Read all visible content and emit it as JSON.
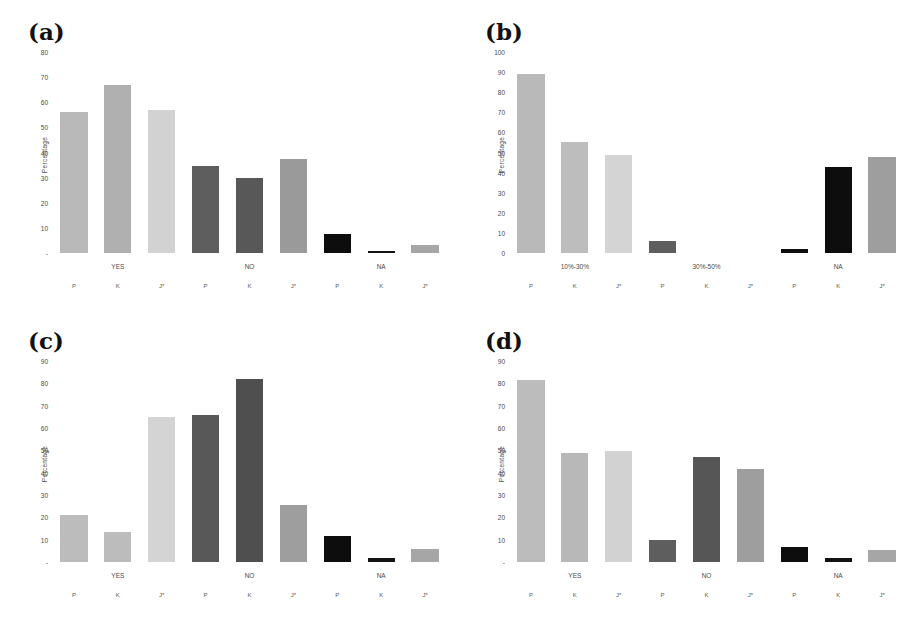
{
  "figure": {
    "background": "#ffffff",
    "panel_count": 4
  },
  "panels": [
    {
      "id": "a",
      "label": "(a)",
      "ylabel": "Percentage",
      "yticks": [
        "-",
        "10",
        "20",
        "30",
        "40",
        "50",
        "60",
        "70",
        "80"
      ],
      "ymax": 80,
      "groups": [
        "YES",
        "NO",
        "NA"
      ],
      "series": [
        "P",
        "K",
        "J*"
      ],
      "bars": [
        {
          "group": "YES",
          "series": "P",
          "value": 56,
          "color": "#b9b9b9"
        },
        {
          "group": "YES",
          "series": "K",
          "value": 67,
          "color": "#b0b0b0"
        },
        {
          "group": "YES",
          "series": "J*",
          "value": 57,
          "color": "#d2d2d2"
        },
        {
          "group": "NO",
          "series": "P",
          "value": 34.5,
          "color": "#5e5e5e"
        },
        {
          "group": "NO",
          "series": "K",
          "value": 30,
          "color": "#585858"
        },
        {
          "group": "NO",
          "series": "J*",
          "value": 37.5,
          "color": "#9a9a9a"
        },
        {
          "group": "NA",
          "series": "P",
          "value": 7.5,
          "color": "#0d0d0d"
        },
        {
          "group": "NA",
          "series": "K",
          "value": 1,
          "color": "#121212"
        },
        {
          "group": "NA",
          "series": "J*",
          "value": 3,
          "color": "#a6a6a6"
        }
      ]
    },
    {
      "id": "b",
      "label": "(b)",
      "ylabel": "Percentage",
      "yticks": [
        "0",
        "10",
        "20",
        "30",
        "40",
        "50",
        "60",
        "70",
        "80",
        "90",
        "100"
      ],
      "ymax": 100,
      "groups": [
        "10%-30%",
        "30%-50%",
        "NA"
      ],
      "series": [
        "P",
        "K",
        "J*"
      ],
      "bars": [
        {
          "group": "10%-30%",
          "series": "P",
          "value": 89,
          "color": "#b9b9b9"
        },
        {
          "group": "10%-30%",
          "series": "K",
          "value": 55,
          "color": "#bdbdbd"
        },
        {
          "group": "10%-30%",
          "series": "J*",
          "value": 49,
          "color": "#d4d4d4"
        },
        {
          "group": "30%-50%",
          "series": "P",
          "value": 6,
          "color": "#5e5e5e"
        },
        {
          "group": "30%-50%",
          "series": "K",
          "value": 0,
          "color": "#585858"
        },
        {
          "group": "30%-50%",
          "series": "J*",
          "value": 0,
          "color": "#9a9a9a"
        },
        {
          "group": "NA",
          "series": "P",
          "value": 2,
          "color": "#0d0d0d"
        },
        {
          "group": "NA",
          "series": "K",
          "value": 43,
          "color": "#0d0d0d"
        },
        {
          "group": "NA",
          "series": "J*",
          "value": 48,
          "color": "#9e9e9e"
        }
      ]
    },
    {
      "id": "c",
      "label": "(c)",
      "ylabel": "Percentage",
      "yticks": [
        "-",
        "10",
        "20",
        "30",
        "40",
        "50",
        "60",
        "70",
        "80",
        "90"
      ],
      "ymax": 90,
      "groups": [
        "YES",
        "NO",
        "NA"
      ],
      "series": [
        "P",
        "K",
        "J*"
      ],
      "bars": [
        {
          "group": "YES",
          "series": "P",
          "value": 21,
          "color": "#bcbcbc"
        },
        {
          "group": "YES",
          "series": "K",
          "value": 13.5,
          "color": "#bcbcbc"
        },
        {
          "group": "YES",
          "series": "J*",
          "value": 65,
          "color": "#d4d4d4"
        },
        {
          "group": "NO",
          "series": "P",
          "value": 66,
          "color": "#585858"
        },
        {
          "group": "NO",
          "series": "K",
          "value": 82,
          "color": "#4f4f4f"
        },
        {
          "group": "NO",
          "series": "J*",
          "value": 25.5,
          "color": "#9e9e9e"
        },
        {
          "group": "NA",
          "series": "P",
          "value": 11.5,
          "color": "#0d0d0d"
        },
        {
          "group": "NA",
          "series": "K",
          "value": 2,
          "color": "#121212"
        },
        {
          "group": "NA",
          "series": "J*",
          "value": 6,
          "color": "#a6a6a6"
        }
      ]
    },
    {
      "id": "d",
      "label": "(d)",
      "ylabel": "Percentage",
      "yticks": [
        "-",
        "10",
        "20",
        "30",
        "40",
        "50",
        "60",
        "70",
        "80",
        "90"
      ],
      "ymax": 90,
      "groups": [
        "YES",
        "NO",
        "NA"
      ],
      "series": [
        "P",
        "K",
        "J*"
      ],
      "bars": [
        {
          "group": "YES",
          "series": "P",
          "value": 81.5,
          "color": "#bcbcbc"
        },
        {
          "group": "YES",
          "series": "K",
          "value": 49,
          "color": "#b8b8b8"
        },
        {
          "group": "YES",
          "series": "J*",
          "value": 49.5,
          "color": "#d2d2d2"
        },
        {
          "group": "NO",
          "series": "P",
          "value": 10,
          "color": "#5e5e5e"
        },
        {
          "group": "NO",
          "series": "K",
          "value": 47,
          "color": "#565656"
        },
        {
          "group": "NO",
          "series": "J*",
          "value": 41.5,
          "color": "#9e9e9e"
        },
        {
          "group": "NA",
          "series": "P",
          "value": 6.5,
          "color": "#0d0d0d"
        },
        {
          "group": "NA",
          "series": "K",
          "value": 2,
          "color": "#121212"
        },
        {
          "group": "NA",
          "series": "J*",
          "value": 5.5,
          "color": "#a6a6a6"
        }
      ]
    }
  ],
  "chart_data": [
    {
      "type": "bar",
      "title": "(a)",
      "xlabel": "",
      "ylabel": "Percentage",
      "ylim": [
        0,
        80
      ],
      "grid": false,
      "legend": "none",
      "categories": [
        "YES-P",
        "YES-K",
        "YES-J*",
        "NO-P",
        "NO-K",
        "NO-J*",
        "NA-P",
        "NA-K",
        "NA-J*"
      ],
      "group_labels": [
        "YES",
        "NO",
        "NA"
      ],
      "tick_labels": [
        "P",
        "K",
        "J*",
        "P",
        "K",
        "J*",
        "P",
        "K",
        "J*"
      ],
      "values": [
        56,
        67,
        57,
        34.5,
        30,
        37.5,
        7.5,
        1,
        3
      ],
      "series": [
        {
          "name": "P",
          "values": [
            56,
            34.5,
            7.5
          ]
        },
        {
          "name": "K",
          "values": [
            67,
            30,
            1
          ]
        },
        {
          "name": "J*",
          "values": [
            57,
            37.5,
            3
          ]
        }
      ]
    },
    {
      "type": "bar",
      "title": "(b)",
      "xlabel": "",
      "ylabel": "Percentage",
      "ylim": [
        0,
        100
      ],
      "grid": false,
      "legend": "none",
      "categories": [
        "10%-30%-P",
        "10%-30%-K",
        "10%-30%-J*",
        "30%-50%-P",
        "30%-50%-K",
        "30%-50%-J*",
        "NA-P",
        "NA-K",
        "NA-J*"
      ],
      "group_labels": [
        "10%-30%",
        "30%-50%",
        "NA"
      ],
      "tick_labels": [
        "P",
        "K",
        "J*",
        "P",
        "K",
        "J*",
        "P",
        "K",
        "J*"
      ],
      "values": [
        89,
        55,
        49,
        6,
        0,
        0,
        2,
        43,
        48
      ],
      "series": [
        {
          "name": "P",
          "values": [
            89,
            6,
            2
          ]
        },
        {
          "name": "K",
          "values": [
            55,
            0,
            43
          ]
        },
        {
          "name": "J*",
          "values": [
            49,
            0,
            48
          ]
        }
      ]
    },
    {
      "type": "bar",
      "title": "(c)",
      "xlabel": "",
      "ylabel": "Percentage",
      "ylim": [
        0,
        90
      ],
      "grid": false,
      "legend": "none",
      "categories": [
        "YES-P",
        "YES-K",
        "YES-J*",
        "NO-P",
        "NO-K",
        "NO-J*",
        "NA-P",
        "NA-K",
        "NA-J*"
      ],
      "group_labels": [
        "YES",
        "NO",
        "NA"
      ],
      "tick_labels": [
        "P",
        "K",
        "J*",
        "P",
        "K",
        "J*",
        "P",
        "K",
        "J*"
      ],
      "values": [
        21,
        13.5,
        65,
        66,
        82,
        25.5,
        11.5,
        2,
        6
      ],
      "series": [
        {
          "name": "P",
          "values": [
            21,
            66,
            11.5
          ]
        },
        {
          "name": "K",
          "values": [
            13.5,
            82,
            2
          ]
        },
        {
          "name": "J*",
          "values": [
            65,
            25.5,
            6
          ]
        }
      ]
    },
    {
      "type": "bar",
      "title": "(d)",
      "xlabel": "",
      "ylabel": "Percentage",
      "ylim": [
        0,
        90
      ],
      "grid": false,
      "legend": "none",
      "categories": [
        "YES-P",
        "YES-K",
        "YES-J*",
        "NO-P",
        "NO-K",
        "NO-J*",
        "NA-P",
        "NA-K",
        "NA-J*"
      ],
      "group_labels": [
        "YES",
        "NO",
        "NA"
      ],
      "tick_labels": [
        "P",
        "K",
        "J*",
        "P",
        "K",
        "J*",
        "P",
        "K",
        "J*"
      ],
      "values": [
        81.5,
        49,
        49.5,
        10,
        47,
        41.5,
        6.5,
        2,
        5.5
      ],
      "series": [
        {
          "name": "P",
          "values": [
            81.5,
            10,
            6.5
          ]
        },
        {
          "name": "K",
          "values": [
            49,
            47,
            2
          ]
        },
        {
          "name": "J*",
          "values": [
            49.5,
            41.5,
            5.5
          ]
        }
      ]
    }
  ]
}
